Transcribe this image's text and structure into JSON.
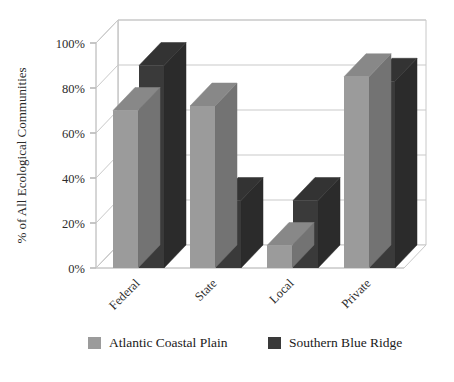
{
  "chart_data": {
    "type": "bar",
    "title": "",
    "subtitle": "",
    "xlabel": "",
    "ylabel": "% of All Ecological Communities",
    "categories": [
      "Federal",
      "State",
      "Local",
      "Private"
    ],
    "series": [
      {
        "name": "Atlantic Coastal Plain",
        "color": "#9b9b9b",
        "values": [
          70,
          72,
          10,
          85
        ]
      },
      {
        "name": "Southern Blue Ridge",
        "color": "#3a3a3a",
        "values": [
          90,
          30,
          30,
          83
        ]
      }
    ],
    "ylim": [
      0,
      100
    ],
    "ytick_labels": [
      "0%",
      "20%",
      "40%",
      "60%",
      "80%",
      "100%"
    ],
    "ytick_values": [
      0,
      20,
      40,
      60,
      80,
      100
    ],
    "grid": true,
    "grid_axis": "y",
    "legend_position": "bottom",
    "style": "3d-column",
    "category_label_rotation": -45
  },
  "legend": {
    "items": [
      {
        "label": "Atlantic Coastal Plain",
        "swatch_color": "#9b9b9b"
      },
      {
        "label": "Southern Blue Ridge",
        "swatch_color": "#3a3a3a"
      }
    ]
  },
  "colors": {
    "series_1_front": "#9b9b9b",
    "series_1_top": "#8a8a8a",
    "series_1_side": "#7a7a7a",
    "series_2_front": "#3a3a3a",
    "series_2_top": "#2c2c2c",
    "series_2_side": "#222222",
    "grid": "#c9c9c9",
    "frame": "#c8c8c8",
    "background": "#ffffff",
    "text": "#1a1a1a"
  }
}
